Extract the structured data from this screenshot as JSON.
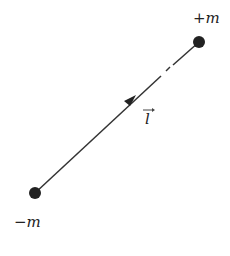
{
  "diagram": {
    "nodes": [
      {
        "id": "neg",
        "label": "−m",
        "x": 35,
        "y": 193
      },
      {
        "id": "pos",
        "label": "+m",
        "x": 199,
        "y": 42
      }
    ],
    "edges": [
      {
        "from": "neg",
        "to": "pos",
        "label": "l",
        "label_vector": "→",
        "arrow_direction": "toward +m"
      }
    ],
    "colors": {
      "line": "#333333",
      "node": "#222222",
      "text": "#222222"
    }
  }
}
